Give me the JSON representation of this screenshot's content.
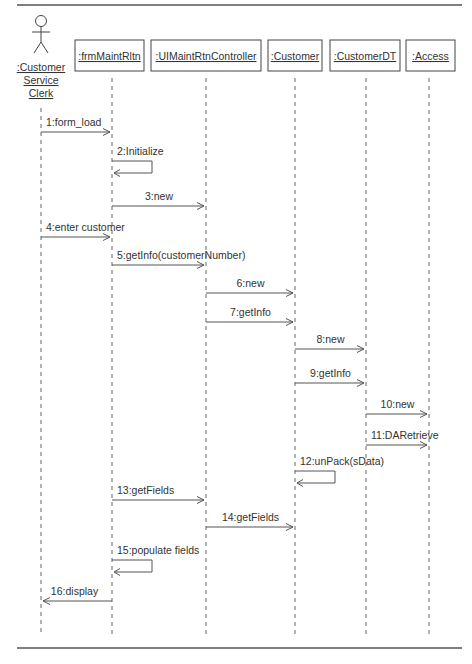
{
  "diagram": {
    "type": "UML sequence diagram",
    "actor": {
      "label_lines": [
        ":Customer",
        "Service",
        "Clerk"
      ],
      "x": 41
    },
    "objects": [
      {
        "id": "frm",
        "label": ":frmMaintRltn",
        "x": 112,
        "box_x": 75,
        "box_w": 69
      },
      {
        "id": "ctrl",
        "label": ":UIMaintRtnController",
        "x": 206,
        "box_x": 151,
        "box_w": 110
      },
      {
        "id": "cust",
        "label": ":Customer",
        "x": 295,
        "box_x": 268,
        "box_w": 54
      },
      {
        "id": "custdt",
        "label": ":CustomerDT",
        "x": 366,
        "box_x": 330,
        "box_w": 70
      },
      {
        "id": "access",
        "label": ":Access",
        "x": 429,
        "box_x": 406,
        "box_w": 49
      }
    ],
    "messages": [
      {
        "n": 1,
        "label": "1:form_load",
        "from": "actor",
        "to": "frm",
        "y": 132,
        "kind": "call"
      },
      {
        "n": 2,
        "label": "2:Initialize",
        "from": "frm",
        "to": "frm",
        "y": 161,
        "kind": "self"
      },
      {
        "n": 3,
        "label": "3:new",
        "from": "frm",
        "to": "ctrl",
        "y": 206,
        "kind": "call"
      },
      {
        "n": 4,
        "label": "4:enter customer",
        "from": "actor",
        "to": "frm",
        "y": 237,
        "kind": "call"
      },
      {
        "n": 5,
        "label": "5:getInfo(customerNumber)",
        "from": "frm",
        "to": "ctrl",
        "y": 265,
        "kind": "call"
      },
      {
        "n": 6,
        "label": "6:new",
        "from": "ctrl",
        "to": "cust",
        "y": 293,
        "kind": "call"
      },
      {
        "n": 7,
        "label": "7:getInfo",
        "from": "ctrl",
        "to": "cust",
        "y": 322,
        "kind": "call"
      },
      {
        "n": 8,
        "label": "8:new",
        "from": "cust",
        "to": "custdt",
        "y": 349,
        "kind": "call"
      },
      {
        "n": 9,
        "label": "9:getInfo",
        "from": "cust",
        "to": "custdt",
        "y": 383,
        "kind": "call"
      },
      {
        "n": 10,
        "label": "10:new",
        "from": "custdt",
        "to": "access",
        "y": 414,
        "kind": "call"
      },
      {
        "n": 11,
        "label": "11:DARetrieve",
        "from": "custdt",
        "to": "access",
        "y": 445,
        "kind": "call"
      },
      {
        "n": 12,
        "label": "12:unPack(sData)",
        "from": "cust",
        "to": "cust",
        "y": 471,
        "kind": "self"
      },
      {
        "n": 13,
        "label": "13:getFields",
        "from": "frm",
        "to": "ctrl",
        "y": 500,
        "kind": "call"
      },
      {
        "n": 14,
        "label": "14:getFields",
        "from": "ctrl",
        "to": "cust",
        "y": 527,
        "kind": "call"
      },
      {
        "n": 15,
        "label": "15:populate fields",
        "from": "frm",
        "to": "frm",
        "y": 560,
        "kind": "self"
      },
      {
        "n": 16,
        "label": "16:display",
        "from": "frm",
        "to": "actor",
        "y": 601,
        "kind": "call"
      }
    ]
  },
  "layout": {
    "top_rule_y": 5,
    "bottom_rule_y": 648,
    "box_y": 40,
    "box_h": 31,
    "lifeline_start": 78,
    "lifeline_end": 634
  }
}
